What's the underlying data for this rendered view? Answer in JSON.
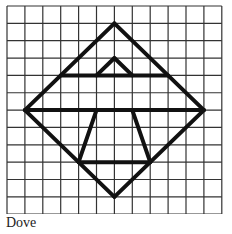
{
  "caption": "Dove",
  "grid": {
    "cols": 12,
    "rows": 12,
    "origin_x": 7,
    "origin_y": 6,
    "cell_w": 17.9,
    "cell_h": 17.35,
    "line_color": "#333333"
  },
  "shape": {
    "stroke_color": "#111111",
    "segments": [
      {
        "name": "diamond-top-right",
        "from": [
          6,
          1
        ],
        "to": [
          11,
          6
        ]
      },
      {
        "name": "diamond-bottom-right",
        "from": [
          11,
          6
        ],
        "to": [
          6,
          11
        ]
      },
      {
        "name": "diamond-bottom-left",
        "from": [
          6,
          11
        ],
        "to": [
          1,
          6
        ]
      },
      {
        "name": "diamond-top-left",
        "from": [
          1,
          6
        ],
        "to": [
          6,
          1
        ]
      },
      {
        "name": "upper-horizontal",
        "from": [
          3,
          4
        ],
        "to": [
          9,
          4
        ]
      },
      {
        "name": "small-triangle-left",
        "from": [
          5,
          4
        ],
        "to": [
          6,
          3
        ]
      },
      {
        "name": "small-triangle-right",
        "from": [
          6,
          3
        ],
        "to": [
          7,
          4
        ]
      },
      {
        "name": "middle-horizontal",
        "from": [
          1,
          6
        ],
        "to": [
          11,
          6
        ]
      },
      {
        "name": "trapezoid-left",
        "from": [
          5,
          6
        ],
        "to": [
          4,
          9
        ]
      },
      {
        "name": "trapezoid-right",
        "from": [
          7,
          6
        ],
        "to": [
          8,
          9
        ]
      },
      {
        "name": "lower-horizontal",
        "from": [
          4,
          9
        ],
        "to": [
          8,
          9
        ]
      }
    ]
  }
}
